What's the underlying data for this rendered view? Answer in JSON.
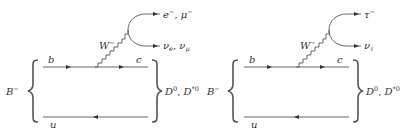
{
  "colors": {
    "line": "#555555",
    "text": "#333333",
    "background": "#ffffff"
  },
  "diagrams": [
    {
      "id": "semileptonic-light",
      "incoming_meson": "B",
      "incoming_meson_charge": "−",
      "outgoing_meson": "D",
      "outgoing_meson_sup": "0",
      "outgoing_meson2": "D",
      "outgoing_meson2_sup": "*0",
      "top_quark_in": "b",
      "top_quark_out": "c",
      "spectator_quark": "u",
      "boson": "W",
      "boson_charge": "−",
      "lepton": "e",
      "lepton_charge": "−",
      "lepton2": "μ",
      "lepton2_charge": "−",
      "neutrino": "ν",
      "neutrino_sub": "e",
      "neutrino2": "ν",
      "neutrino2_sub": "μ"
    },
    {
      "id": "semileptonic-tau",
      "incoming_meson": "B",
      "incoming_meson_charge": "−",
      "outgoing_meson": "D",
      "outgoing_meson_sup": "0",
      "outgoing_meson2": "D",
      "outgoing_meson2_sup": "*0",
      "top_quark_in": "b",
      "top_quark_out": "c",
      "spectator_quark": "u",
      "boson": "W",
      "boson_charge": "−",
      "lepton": "τ",
      "lepton_charge": "−",
      "neutrino": "ν",
      "neutrino_sub": "τ"
    }
  ],
  "separators": {
    "comma": ","
  }
}
